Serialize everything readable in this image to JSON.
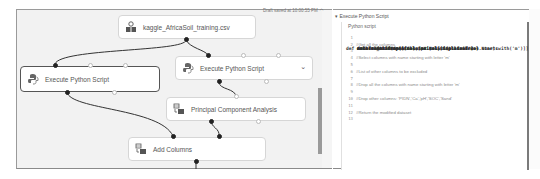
{
  "canvas": {
    "nodes": [
      {
        "id": "dataset",
        "label": "kaggle_AfricaSoil_training.csv",
        "icon": "dataset-icon"
      },
      {
        "id": "python1",
        "label": "Execute Python Script",
        "icon": "python-icon",
        "selected": true
      },
      {
        "id": "python2",
        "label": "Execute Python Script",
        "icon": "python-icon"
      },
      {
        "id": "pca",
        "label": "Principal Component Analysis",
        "icon": "module-icon"
      },
      {
        "id": "addcols",
        "label": "Add Columns",
        "icon": "module-icon"
      }
    ],
    "saved_status": "Draft saved at 10:00:55 PM",
    "saved_chevron": "^"
  },
  "properties_panel": {
    "section_title": "Execute Python Script",
    "field_label": "Python script",
    "code_lines": [
      {
        "n": "1",
        "text": "def azureml_main(dataframe1 = None, dataframe2 = None):",
        "type": "code"
      },
      {
        "n": "2",
        "text": "#Get all the columns",
        "type": "comment"
      },
      {
        "n": "3",
        "text": "    cols = dataframe1.columns.tolist()",
        "type": "code"
      },
      {
        "n": "4",
        "text": "#Select columns with name starting with letter 'm'",
        "type": "comment"
      },
      {
        "n": "5",
        "text": "    mcols=dataframe1[[col for col in cols if col.startswith('m')]]",
        "type": "code"
      },
      {
        "n": "6",
        "text": "#List of other columns to be excluded",
        "type": "comment"
      },
      {
        "n": "7",
        "text": "    exCols=['PIDN', 'Ca', 'pH', 'SOC', 'Sand']",
        "type": "code"
      },
      {
        "n": "8",
        "text": "#Drop all the columns with name starting with letter 'm'",
        "type": "comment"
      },
      {
        "n": "9",
        "text": "    dataframe1.drop(mcols, axis=1, inplace=True)",
        "type": "code"
      },
      {
        "n": "10",
        "text": "#Drop other columns: 'PIDN','Ca','pH','SOC','Sand'",
        "type": "comment"
      },
      {
        "n": "11",
        "text": "    dataframe1.drop(exCols,axis=1, inplace=True)",
        "type": "code"
      },
      {
        "n": "12",
        "text": "#Return the modified dataset",
        "type": "comment"
      },
      {
        "n": "13",
        "text": "    return dataframe1",
        "type": "code"
      }
    ]
  }
}
